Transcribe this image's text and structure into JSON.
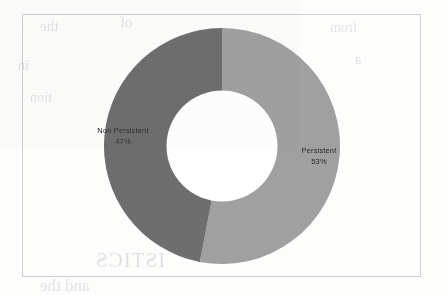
{
  "chart_data": {
    "type": "pie",
    "variant": "donut",
    "title": "",
    "subtitle": "",
    "xlabel": "",
    "ylabel": "",
    "legend": "none",
    "grid": false,
    "start_angle_deg": 0,
    "direction": "clockwise",
    "hole_ratio": 0.47,
    "categories": [
      "Persistent",
      "Non Persistent"
    ],
    "values": [
      53,
      47
    ],
    "units": "%",
    "slices": [
      {
        "name": "Persistent",
        "label": "Persistent",
        "value": 53,
        "pct_text": "53%",
        "color": "#a0a0a0",
        "start_deg": 0,
        "end_deg": 190.8
      },
      {
        "name": "Non Persistent",
        "label": "Non Persistent",
        "value": 47,
        "pct_text": "47%",
        "color": "#6e6e6e",
        "start_deg": 190.8,
        "end_deg": 360
      }
    ]
  },
  "colors": {
    "persistent": "#a0a0a0",
    "non_persistent": "#6e6e6e",
    "plot_border": "#cfcfcf",
    "label_text": "#1c1c1c",
    "background": "#fdfdfc",
    "hole": "#ffffff"
  },
  "bleed_text": {
    "line1": "the",
    "line2": "of",
    "line3": "from",
    "line4": "in",
    "line5": "a",
    "line6": "tion",
    "line7": "ISTICS",
    "line8": "and the"
  }
}
